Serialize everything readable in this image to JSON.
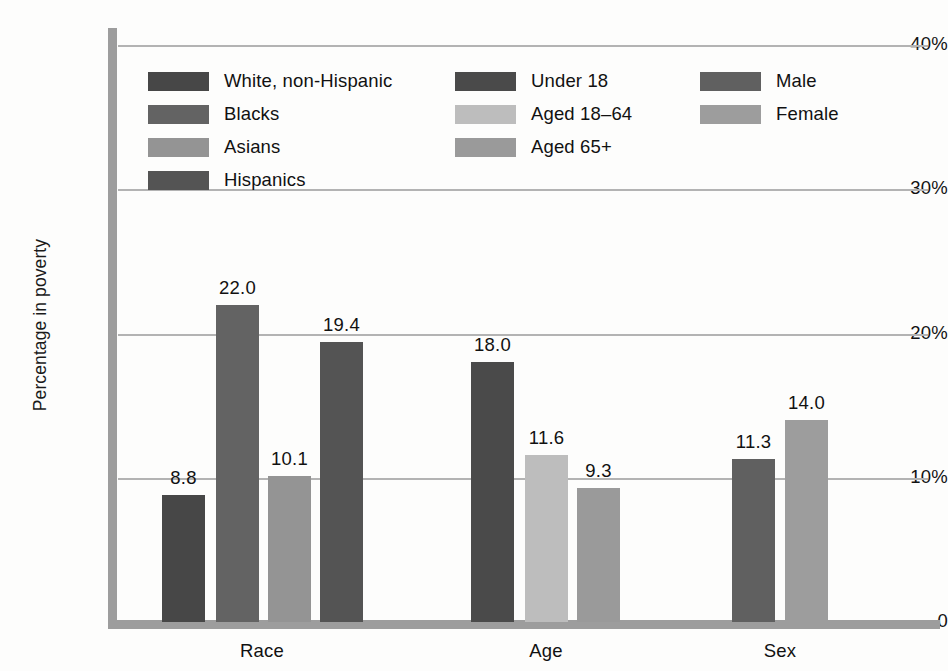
{
  "chart_data": {
    "type": "bar",
    "title": "",
    "subtitle": "",
    "xlabel": "",
    "ylabel": "Percentage in poverty",
    "ylim": [
      0,
      40
    ],
    "yticks": [
      "0",
      "10%",
      "20%",
      "30%",
      "40%"
    ],
    "ytick_values": [
      0,
      10,
      20,
      30,
      40
    ],
    "grid": "horizontal",
    "legend_position": "inside-top-left",
    "groups": [
      "Race",
      "Age",
      "Sex"
    ],
    "categories": [
      "White, non-Hispanic",
      "Blacks",
      "Asians",
      "Hispanics",
      "Under 18",
      "Aged 18–64",
      "Aged 65+",
      "Male",
      "Female"
    ],
    "values": [
      8.8,
      22.0,
      10.1,
      19.4,
      18.0,
      11.6,
      9.3,
      11.3,
      14.0
    ],
    "value_labels": [
      "8.8",
      "22.0",
      "10.1",
      "19.4",
      "18.0",
      "11.6",
      "9.3",
      "11.3",
      "14.0"
    ],
    "series": [
      {
        "group": "Race",
        "bars": [
          {
            "name": "White, non-Hispanic",
            "value": 8.8,
            "label": "8.8",
            "color": "#474747"
          },
          {
            "name": "Blacks",
            "value": 22.0,
            "label": "22.0",
            "color": "#636363"
          },
          {
            "name": "Asians",
            "value": 10.1,
            "label": "10.1",
            "color": "#949494"
          },
          {
            "name": "Hispanics",
            "value": 19.4,
            "label": "19.4",
            "color": "#545454"
          }
        ]
      },
      {
        "group": "Age",
        "bars": [
          {
            "name": "Under 18",
            "value": 18.0,
            "label": "18.0",
            "color": "#4a4a4a"
          },
          {
            "name": "Aged 18–64",
            "value": 11.6,
            "label": "11.6",
            "color": "#bdbdbd"
          },
          {
            "name": "Aged 65+",
            "value": 9.3,
            "label": "9.3",
            "color": "#9a9a9a"
          }
        ]
      },
      {
        "group": "Sex",
        "bars": [
          {
            "name": "Male",
            "value": 11.3,
            "label": "11.3",
            "color": "#606060"
          },
          {
            "name": "Female",
            "value": 14.0,
            "label": "14.0",
            "color": "#9d9d9d"
          }
        ]
      }
    ]
  },
  "axis": {
    "y_title": "Percentage in poverty",
    "ticks": [
      {
        "label": "40%",
        "value": 40
      },
      {
        "label": "30%",
        "value": 30
      },
      {
        "label": "20%",
        "value": 20
      },
      {
        "label": "10%",
        "value": 10
      },
      {
        "label": "0",
        "value": 0
      }
    ]
  },
  "group_labels": [
    {
      "text": "Race",
      "center": 262
    },
    {
      "text": "Age",
      "center": 546
    },
    {
      "text": "Sex",
      "center": 780
    }
  ],
  "legend": {
    "columns": [
      {
        "name": "race-legend",
        "left": 148,
        "top": 66,
        "items": [
          {
            "label": "White, non-Hispanic",
            "color": "#474747"
          },
          {
            "label": "Blacks",
            "color": "#636363"
          },
          {
            "label": "Asians",
            "color": "#949494"
          },
          {
            "label": "Hispanics",
            "color": "#545454"
          }
        ]
      },
      {
        "name": "age-legend",
        "left": 455,
        "top": 66,
        "items": [
          {
            "label": "Under 18",
            "color": "#4a4a4a"
          },
          {
            "label": "Aged 18–64",
            "color": "#bdbdbd"
          },
          {
            "label": "Aged 65+",
            "color": "#9a9a9a"
          }
        ]
      },
      {
        "name": "sex-legend",
        "left": 700,
        "top": 66,
        "items": [
          {
            "label": "Male",
            "color": "#606060"
          },
          {
            "label": "Female",
            "color": "#9d9d9d"
          }
        ]
      }
    ]
  },
  "geometry": {
    "baseline_y": 622,
    "top_y": 45,
    "px_per_unit": 14.425,
    "bar_width": 43,
    "bars": [
      {
        "x": 162
      },
      {
        "x": 216
      },
      {
        "x": 268
      },
      {
        "x": 320
      },
      {
        "x": 471
      },
      {
        "x": 525
      },
      {
        "x": 577
      },
      {
        "x": 732
      },
      {
        "x": 785
      }
    ]
  }
}
